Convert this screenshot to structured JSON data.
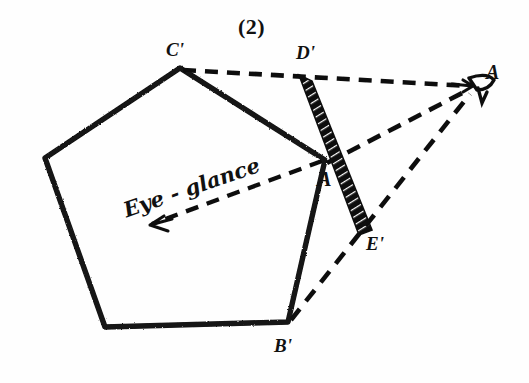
{
  "figure": {
    "number_label": "(2)",
    "background_color": "#fefefe",
    "ink_color": "#111111"
  },
  "labels": {
    "vertex_c_prime": "C'",
    "vertex_d_prime": "D'",
    "vertex_b_prime": "B'",
    "vertex_e_prime": "E'",
    "vertex_a_prime": "A",
    "eye_point": "A",
    "annotation_eye_glance": "Eye - glance"
  },
  "geometry": {
    "pentagon_points": "180,68 45,158 105,327 288,322 325,160",
    "solid_edges": [
      {
        "name": "edge-c-to-left",
        "x1": 180,
        "y1": 68,
        "x2": 45,
        "y2": 158
      },
      {
        "name": "edge-left-to-bottomleft",
        "x1": 45,
        "y1": 158,
        "x2": 105,
        "y2": 327
      },
      {
        "name": "edge-bottomleft-to-b",
        "x1": 105,
        "y1": 327,
        "x2": 288,
        "y2": 322
      },
      {
        "name": "edge-b-to-a",
        "x1": 288,
        "y1": 322,
        "x2": 325,
        "y2": 160
      },
      {
        "name": "edge-a-to-c",
        "x1": 325,
        "y1": 160,
        "x2": 180,
        "y2": 68
      }
    ],
    "dashed_sight_lines": [
      {
        "name": "sightline-c-prime-to-eye",
        "x1": 183,
        "y1": 70,
        "x2": 474,
        "y2": 86
      },
      {
        "name": "sightline-a-prime-to-eye",
        "x1": 327,
        "y1": 163,
        "x2": 474,
        "y2": 90
      },
      {
        "name": "sightline-b-prime-to-eye",
        "x1": 291,
        "y1": 320,
        "x2": 474,
        "y2": 93
      }
    ],
    "dashed_glance_line": {
      "name": "eye-glance-ray",
      "x1": 322,
      "y1": 161,
      "x2": 146,
      "y2": 226
    },
    "hatched_band": {
      "name": "picture-plane-band",
      "top_x": 305,
      "top_y": 78,
      "bottom_x": 366,
      "bottom_y": 232,
      "width": 13
    },
    "eye_point_position": {
      "x": 478,
      "y": 84
    }
  },
  "label_positions": {
    "figure_number": {
      "x": 238,
      "y": 20
    },
    "c_prime": {
      "x": 166,
      "y": 42
    },
    "d_prime": {
      "x": 297,
      "y": 45
    },
    "b_prime": {
      "x": 276,
      "y": 338
    },
    "e_prime": {
      "x": 368,
      "y": 237
    },
    "a_center": {
      "x": 320,
      "y": 172
    },
    "eye_point": {
      "x": 483,
      "y": 68
    },
    "eye_glance": {
      "x": 124,
      "y": 210
    }
  }
}
